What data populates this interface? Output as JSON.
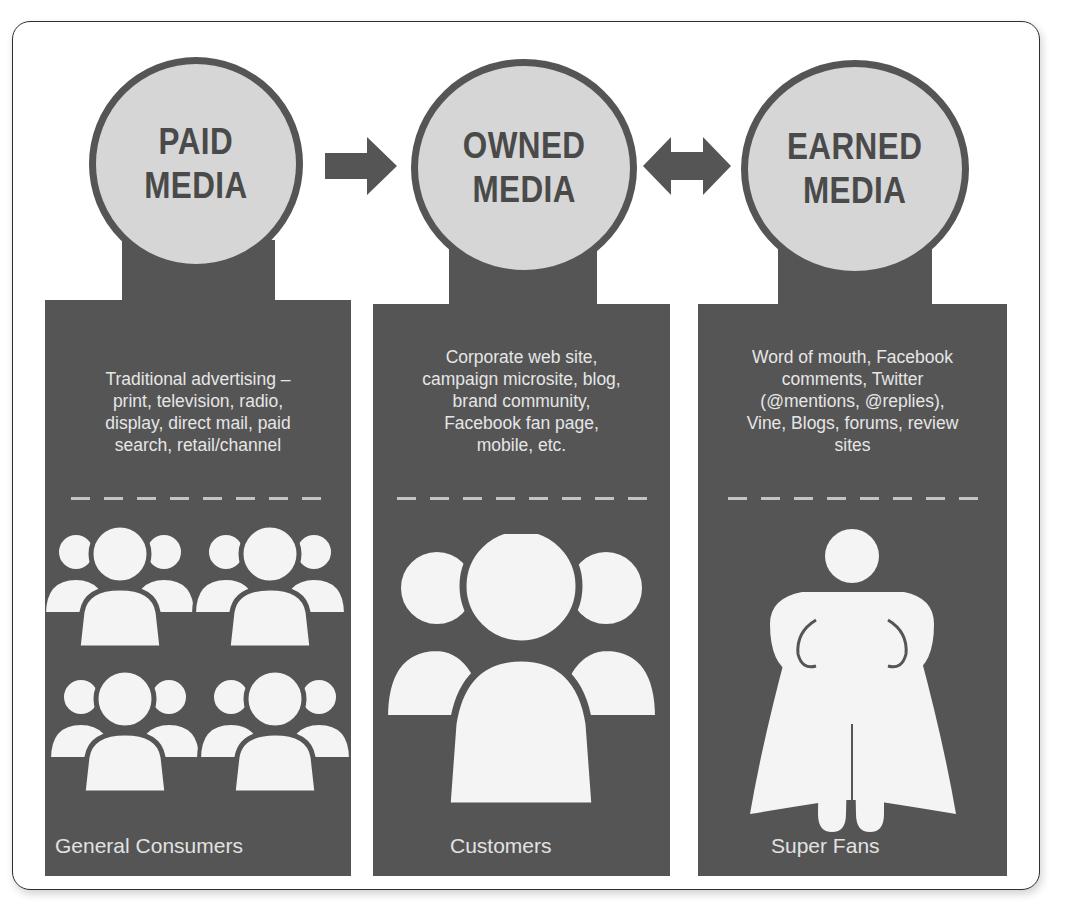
{
  "diagram": {
    "colors": {
      "panel": "#555555",
      "circle_fill": "#d6d6d6",
      "circle_border": "#555555",
      "title_text": "#4a4a4a",
      "panel_text": "#e6e6e6",
      "frame_border": "#2e2e2e"
    },
    "columns": [
      {
        "title_line1": "PAID",
        "title_line2": "MEDIA",
        "description": "Traditional advertising – print, television, radio, display, direct mail, paid search, retail/channel",
        "description_lines": [
          "Traditional advertising –",
          "print, television, radio,",
          "display, direct mail, paid",
          "search, retail/channel"
        ],
        "icon": "crowd-icon",
        "audience": "General Consumers"
      },
      {
        "title_line1": "OWNED",
        "title_line2": "MEDIA",
        "description": "Corporate web site, campaign microsite, blog, brand community, Facebook fan page, mobile, etc.",
        "description_lines": [
          "Corporate web site,",
          "campaign microsite, blog,",
          "brand community,",
          "Facebook fan page,",
          "mobile, etc."
        ],
        "icon": "group-icon",
        "audience": "Customers"
      },
      {
        "title_line1": "EARNED",
        "title_line2": "MEDIA",
        "description": "Word of mouth, Facebook comments, Twitter (@mentions, @replies), Vine, Blogs, forums, review sites",
        "description_lines": [
          "Word of mouth, Facebook",
          "comments, Twitter",
          "(@mentions, @replies),",
          "Vine, Blogs, forums, review",
          "sites"
        ],
        "icon": "superhero-icon",
        "audience": "Super Fans"
      }
    ],
    "connectors": [
      {
        "from": "PAID MEDIA",
        "to": "OWNED MEDIA",
        "type": "right-arrow"
      },
      {
        "from": "OWNED MEDIA",
        "to": "EARNED MEDIA",
        "type": "double-arrow"
      }
    ]
  }
}
